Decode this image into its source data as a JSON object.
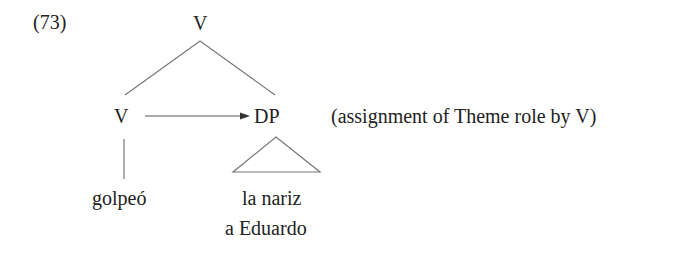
{
  "example_number": "(73)",
  "tree": {
    "root": "V",
    "left_child": "V",
    "right_child": "DP",
    "left_leaf": "golpeó",
    "right_leaf_line1": "la nariz",
    "right_leaf_line2": "a Eduardo"
  },
  "annotation": "(assignment of Theme role by V)",
  "colors": {
    "text": "#222222",
    "lines": "#777777"
  }
}
